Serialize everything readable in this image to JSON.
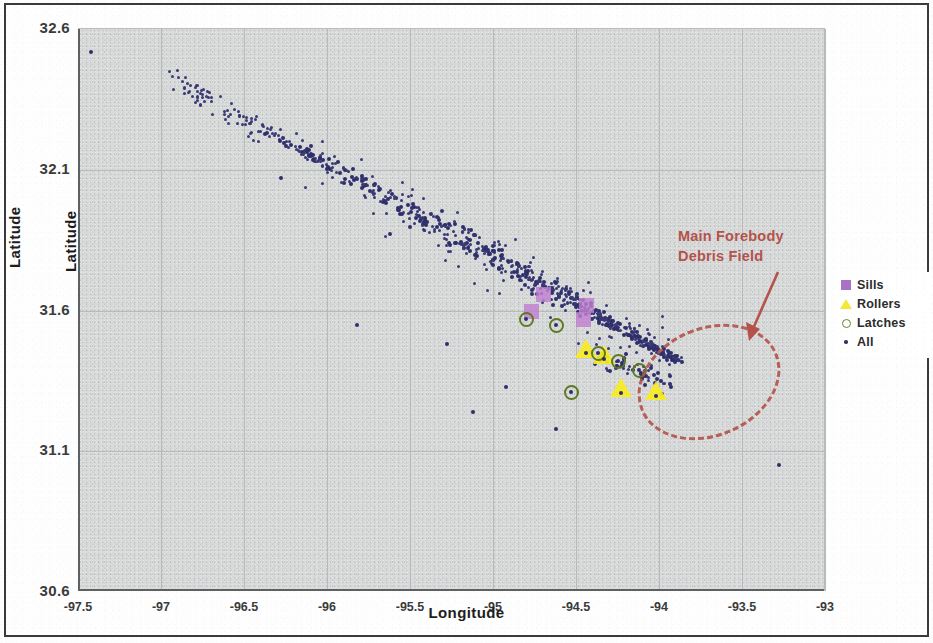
{
  "axes": {
    "x_title": "Longitude",
    "y_title": "Latitude",
    "y_title_inner": "Latitude"
  },
  "annotation": {
    "line1": "Main Forebody",
    "line2": "Debris Field",
    "color": "#b5524a"
  },
  "legend": {
    "items": [
      {
        "label": "Sills",
        "icon": "purple-square-marker",
        "color": "#a972c4"
      },
      {
        "label": "Rollers",
        "icon": "yellow-triangle-marker",
        "color": "#f2e93a"
      },
      {
        "label": "Latches",
        "icon": "green-circle-outline-marker",
        "color": "#69862c"
      },
      {
        "label": "All",
        "icon": "small-dot-marker",
        "color": "#33335e"
      }
    ]
  },
  "chart_data": {
    "type": "scatter",
    "title": "",
    "xlabel": "Longitude",
    "ylabel": "Latitude",
    "xlim": [
      -97.5,
      -93.0
    ],
    "ylim": [
      30.6,
      32.6
    ],
    "xticks": [
      "-97.5",
      "-97",
      "-96.5",
      "-96",
      "-95.5",
      "-95",
      "-94.5",
      "-94",
      "-93.5",
      "-93"
    ],
    "yticks": [
      "32.6",
      "32.1",
      "31.6",
      "31.1",
      "30.6"
    ],
    "ytick_values": [
      32.6,
      32.1,
      31.6,
      31.1,
      30.6
    ],
    "xtick_values": [
      -97.5,
      -97,
      -96.5,
      -96,
      -95.5,
      -95,
      -94.5,
      -94,
      -93.5,
      -93
    ],
    "grid": true,
    "plot_background": "#d8dada",
    "legend_position": "right-outside",
    "annotations": [
      {
        "text": "Main Forebody Debris Field",
        "type": "arrow-callout",
        "color": "#b5524a",
        "points_to": [
          -94.1,
          31.42
        ]
      },
      {
        "text": "",
        "type": "dashed-ellipse",
        "color": "#b5524a",
        "center": [
          -94.15,
          31.4
        ],
        "width_deg": 0.89,
        "height_deg": 0.39,
        "rotation_deg": -23
      }
    ],
    "series": [
      {
        "name": "All",
        "marker": "dot",
        "color": "#2f2f6b",
        "point_count_visible": 520,
        "description": "Dense linear debris streak running from northwest near (-96.4, 32.25) southeast to (-93.9, 31.42)",
        "notable_outliers": [
          [
            -97.42,
            32.52
          ],
          [
            -96.28,
            32.07
          ],
          [
            -95.62,
            31.87
          ],
          [
            -95.82,
            31.55
          ],
          [
            -95.28,
            31.48
          ],
          [
            -95.12,
            31.24
          ],
          [
            -94.92,
            31.33
          ],
          [
            -93.28,
            31.05
          ],
          [
            -94.62,
            31.18
          ]
        ]
      },
      {
        "name": "Sills",
        "marker": "square",
        "color": "#c07fd0",
        "points": [
          [
            -94.77,
            31.6
          ],
          [
            -94.7,
            31.66
          ],
          [
            -94.46,
            31.57
          ],
          [
            -94.44,
            31.62
          ]
        ]
      },
      {
        "name": "Rollers",
        "marker": "triangle",
        "color": "#f7ec24",
        "points": [
          [
            -94.44,
            31.46
          ],
          [
            -94.33,
            31.44
          ],
          [
            -94.23,
            31.32
          ],
          [
            -94.02,
            31.31
          ]
        ]
      },
      {
        "name": "Latches",
        "marker": "circle-outline",
        "color": "#5e7a23",
        "points": [
          [
            -94.8,
            31.57
          ],
          [
            -94.62,
            31.55
          ],
          [
            -94.37,
            31.45
          ],
          [
            -94.25,
            31.42
          ],
          [
            -94.12,
            31.39
          ],
          [
            -94.53,
            31.31
          ]
        ]
      }
    ]
  }
}
